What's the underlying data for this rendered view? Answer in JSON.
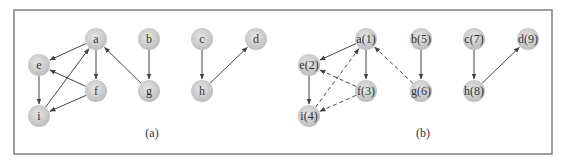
{
  "figure": {
    "frame": {
      "x": 14,
      "y": 10,
      "width": 538,
      "height": 144,
      "stroke": "#808080"
    },
    "node_style": {
      "radius": 11,
      "fill_center": "#e6e6e6",
      "fill_edge": "#bdbdbd",
      "text_color": "#333333"
    },
    "edge_color": "#444444",
    "panels": [
      {
        "caption": "(a)",
        "caption_pos": {
          "x": 152,
          "y": 137
        },
        "nodes": [
          {
            "id": "a",
            "label": "a",
            "x": 96,
            "y": 39
          },
          {
            "id": "b",
            "label": "b",
            "x": 149,
            "y": 39
          },
          {
            "id": "c",
            "label": "c",
            "x": 202,
            "y": 39
          },
          {
            "id": "d",
            "label": "d",
            "x": 256,
            "y": 39
          },
          {
            "id": "e",
            "label": "e",
            "x": 39,
            "y": 65
          },
          {
            "id": "f",
            "label": "f",
            "x": 96,
            "y": 91
          },
          {
            "id": "g",
            "label": "g",
            "x": 149,
            "y": 91
          },
          {
            "id": "h",
            "label": "h",
            "x": 202,
            "y": 91
          },
          {
            "id": "i",
            "label": "i",
            "x": 39,
            "y": 116
          }
        ],
        "edges": [
          {
            "from": "a",
            "to": "e",
            "style": "solid"
          },
          {
            "from": "a",
            "to": "f",
            "style": "solid"
          },
          {
            "from": "e",
            "to": "i",
            "style": "solid"
          },
          {
            "from": "i",
            "to": "a",
            "style": "solid"
          },
          {
            "from": "f",
            "to": "e",
            "style": "solid"
          },
          {
            "from": "f",
            "to": "i",
            "style": "solid"
          },
          {
            "from": "g",
            "to": "a",
            "style": "solid"
          },
          {
            "from": "b",
            "to": "g",
            "style": "solid"
          },
          {
            "from": "c",
            "to": "h",
            "style": "solid"
          },
          {
            "from": "h",
            "to": "d",
            "style": "solid"
          }
        ]
      },
      {
        "caption": "(b)",
        "caption_pos": {
          "x": 423,
          "y": 137
        },
        "nodes": [
          {
            "id": "a",
            "label": "a(1)",
            "x": 366,
            "y": 39
          },
          {
            "id": "b",
            "label": "b(5)",
            "x": 421,
            "y": 39
          },
          {
            "id": "c",
            "label": "c(7)",
            "x": 474,
            "y": 39
          },
          {
            "id": "d",
            "label": "d(9)",
            "x": 528,
            "y": 39
          },
          {
            "id": "e",
            "label": "e(2)",
            "x": 309,
            "y": 65
          },
          {
            "id": "f",
            "label": "f(3)",
            "x": 366,
            "y": 91
          },
          {
            "id": "g",
            "label": "g(6)",
            "x": 421,
            "y": 91
          },
          {
            "id": "h",
            "label": "h(8)",
            "x": 474,
            "y": 91
          },
          {
            "id": "i",
            "label": "i(4)",
            "x": 309,
            "y": 116
          }
        ],
        "edges": [
          {
            "from": "a",
            "to": "e",
            "style": "solid"
          },
          {
            "from": "a",
            "to": "f",
            "style": "solid"
          },
          {
            "from": "e",
            "to": "i",
            "style": "solid"
          },
          {
            "from": "i",
            "to": "a",
            "style": "dashed"
          },
          {
            "from": "f",
            "to": "e",
            "style": "dashed"
          },
          {
            "from": "f",
            "to": "i",
            "style": "dashed"
          },
          {
            "from": "g",
            "to": "a",
            "style": "dashed"
          },
          {
            "from": "b",
            "to": "g",
            "style": "solid"
          },
          {
            "from": "c",
            "to": "h",
            "style": "solid"
          },
          {
            "from": "h",
            "to": "d",
            "style": "solid"
          }
        ]
      }
    ]
  }
}
